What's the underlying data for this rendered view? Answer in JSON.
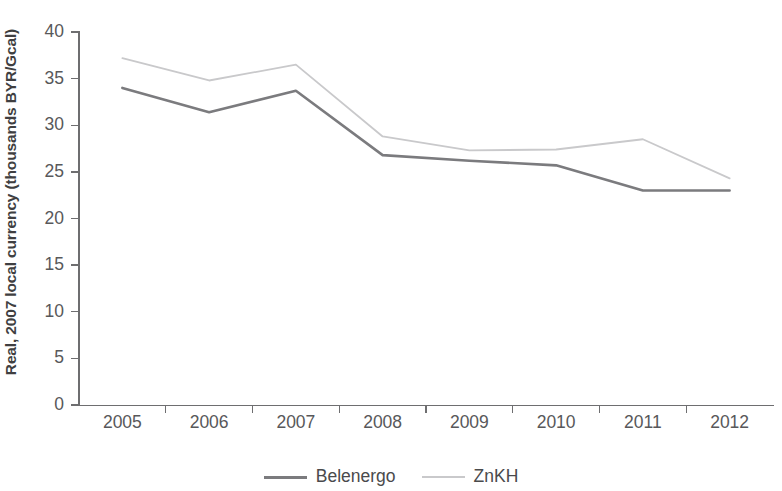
{
  "chart_data": {
    "type": "line",
    "title": "",
    "xlabel": "",
    "ylabel": "Real, 2007 local currency (thousands BYR/Gcal)",
    "categories": [
      "2005",
      "2006",
      "2007",
      "2008",
      "2009",
      "2010",
      "2011",
      "2012"
    ],
    "x": [
      2005,
      2006,
      2007,
      2008,
      2009,
      2010,
      2011,
      2012
    ],
    "series": [
      {
        "name": "Belenergo",
        "color": "#7b7b7e",
        "values": [
          34.0,
          31.4,
          33.7,
          26.8,
          26.2,
          25.7,
          23.0,
          23.0
        ]
      },
      {
        "name": "ZnKH",
        "color": "#c9c9cb",
        "values": [
          37.2,
          34.8,
          36.5,
          28.8,
          27.3,
          27.4,
          28.5,
          24.3
        ]
      }
    ],
    "ylim": [
      0,
      40
    ],
    "yticks": [
      0,
      5,
      10,
      15,
      20,
      25,
      30,
      35,
      40
    ],
    "ytick_labels": [
      "0",
      "5",
      "10",
      "15",
      "20",
      "25",
      "30",
      "35",
      "40"
    ],
    "grid": false,
    "legend_position": "bottom"
  },
  "legend": {
    "items": [
      {
        "label": "Belenergo",
        "color": "#7b7b7e"
      },
      {
        "label": "ZnKH",
        "color": "#c9c9cb"
      }
    ]
  }
}
